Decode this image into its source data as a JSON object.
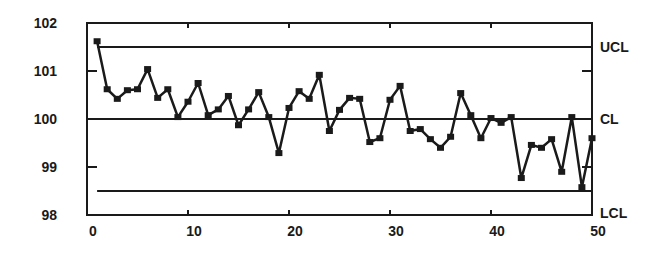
{
  "chart_data": {
    "type": "line",
    "title": "",
    "subtitle": "",
    "xlabel": "",
    "ylabel": "",
    "xlim": [
      0,
      50
    ],
    "ylim": [
      98,
      102
    ],
    "grid": false,
    "legend": null,
    "x_ticks": [
      0,
      10,
      20,
      30,
      40,
      50
    ],
    "y_ticks": [
      98,
      99,
      100,
      101,
      102
    ],
    "x_tick_labels": [
      "0",
      "10",
      "20",
      "30",
      "40",
      "50"
    ],
    "y_tick_labels": [
      "98",
      "99",
      "100",
      "101",
      "102"
    ],
    "series": [
      {
        "name": "Sample measurements",
        "marker": "square",
        "x": [
          1,
          2,
          3,
          4,
          5,
          6,
          7,
          8,
          9,
          10,
          11,
          12,
          13,
          14,
          15,
          16,
          17,
          18,
          19,
          20,
          21,
          22,
          23,
          24,
          25,
          26,
          27,
          28,
          29,
          30,
          31,
          32,
          33,
          34,
          35,
          36,
          37,
          38,
          39,
          40,
          41,
          42,
          43,
          44,
          45,
          46,
          47,
          48,
          49,
          50
        ],
        "values": [
          101.62,
          100.62,
          100.42,
          100.6,
          100.62,
          101.04,
          100.44,
          100.62,
          100.04,
          100.36,
          100.75,
          100.08,
          100.2,
          100.48,
          99.87,
          100.2,
          100.56,
          100.04,
          99.29,
          100.23,
          100.58,
          100.42,
          100.92,
          99.75,
          100.19,
          100.44,
          100.42,
          99.52,
          99.6,
          100.4,
          100.69,
          99.75,
          99.79,
          99.58,
          99.4,
          99.63,
          100.54,
          100.08,
          99.6,
          100.02,
          99.92,
          100.04,
          98.77,
          99.46,
          99.4,
          99.58,
          98.9,
          100.04,
          98.58,
          99.6
        ]
      }
    ],
    "control_lines": [
      {
        "label": "UCL",
        "value": 101.5,
        "x_start": 1
      },
      {
        "label": "CL",
        "value": 100.0,
        "x_start": 0
      },
      {
        "label": "LCL",
        "value": 98.5,
        "x_start": 1
      }
    ],
    "annotations": [
      "UCL",
      "CL",
      "LCL"
    ]
  },
  "style": {
    "line_color": "#1a1a1a",
    "background": "#ffffff"
  }
}
